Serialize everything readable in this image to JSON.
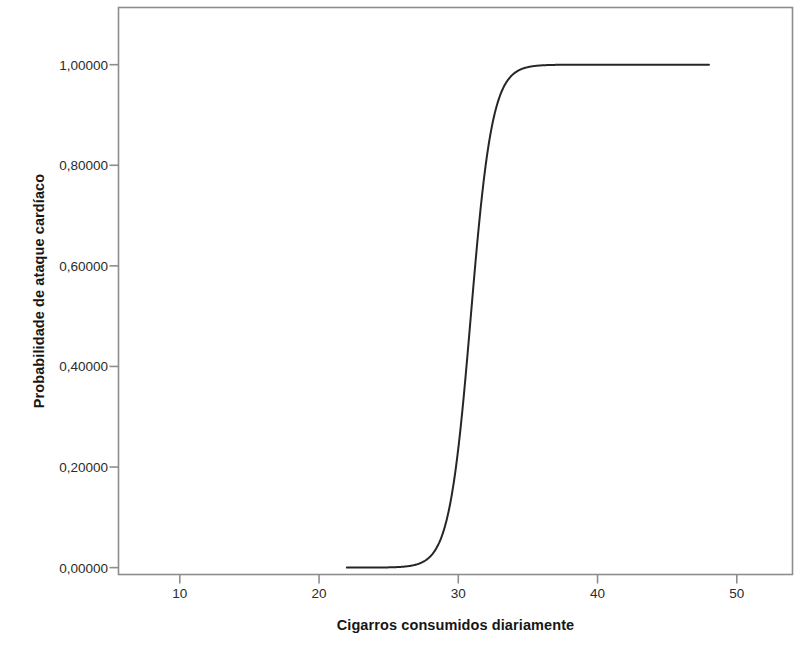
{
  "chart_data": {
    "type": "line",
    "title": "",
    "xlabel": "Cigarros consumidos diariamente",
    "ylabel": "Probabilidade de ataque cardíaco",
    "xlim": [
      5.6,
      54.0
    ],
    "ylim": [
      -0.0137,
      1.1137
    ],
    "grid": false,
    "legend": null,
    "x_ticks": [
      10,
      20,
      30,
      40,
      50
    ],
    "x_tick_labels": [
      "10",
      "20",
      "30",
      "40",
      "50"
    ],
    "y_ticks": [
      0.0,
      0.2,
      0.4,
      0.6,
      0.8,
      1.0
    ],
    "y_tick_labels": [
      "0,00000",
      "0,20000",
      "0,40000",
      "0,60000",
      "0,80000",
      "1,00000"
    ],
    "series": [
      {
        "name": "Probabilidade prevista (regressão logística)",
        "color": "#262626",
        "line_width": 2.0,
        "model": "logistic",
        "midpoint_x": 30.9,
        "slope_k": 1.3,
        "x": [
          22.0,
          23.0,
          24.0,
          25.0,
          26.0,
          27.0,
          28.0,
          28.5,
          29.0,
          29.5,
          30.0,
          30.5,
          30.9,
          31.5,
          32.0,
          32.5,
          33.0,
          33.5,
          34.0,
          35.0,
          36.0,
          37.0,
          38.0,
          40.0,
          42.0,
          44.0,
          46.0,
          48.0
        ],
        "values": [
          0.0,
          0.0001,
          0.0002,
          0.0008,
          0.003,
          0.0109,
          0.0393,
          0.0736,
          0.1341,
          0.2331,
          0.3774,
          0.5498,
          0.65,
          0.7858,
          0.8583,
          0.915,
          0.9519,
          0.974,
          0.9867,
          0.9963,
          0.999,
          0.9997,
          0.9999,
          1.0,
          1.0,
          1.0,
          1.0,
          1.0
        ]
      }
    ]
  },
  "axes": {
    "frame_color": "#8d8d8d",
    "line_color": "#262626",
    "background": "#ffffff"
  }
}
